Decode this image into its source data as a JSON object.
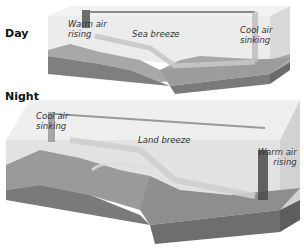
{
  "figure": {
    "colors": {
      "air_box": "#e9e9e9",
      "air_box_side": "#d4d4d4",
      "land": "#8f8f8f",
      "land_dark": "#6e6e6e",
      "sea": "#9a9a9a",
      "sea_side": "#7d7d7d",
      "flow_arrow": "#bdbdbd",
      "column_dark": "#555555"
    }
  },
  "panels": [
    {
      "title": "Day",
      "labels": {
        "warm_air": "Warm air",
        "warm_air_2": "rising",
        "breeze": "Sea breeze",
        "cool_air": "Cool air",
        "cool_air_2": "sinking"
      }
    },
    {
      "title": "Night",
      "labels": {
        "cool_air": "Cool air",
        "cool_air_2": "sinking",
        "breeze": "Land breeze",
        "warm_air": "Warm air",
        "warm_air_2": "rising"
      }
    }
  ]
}
